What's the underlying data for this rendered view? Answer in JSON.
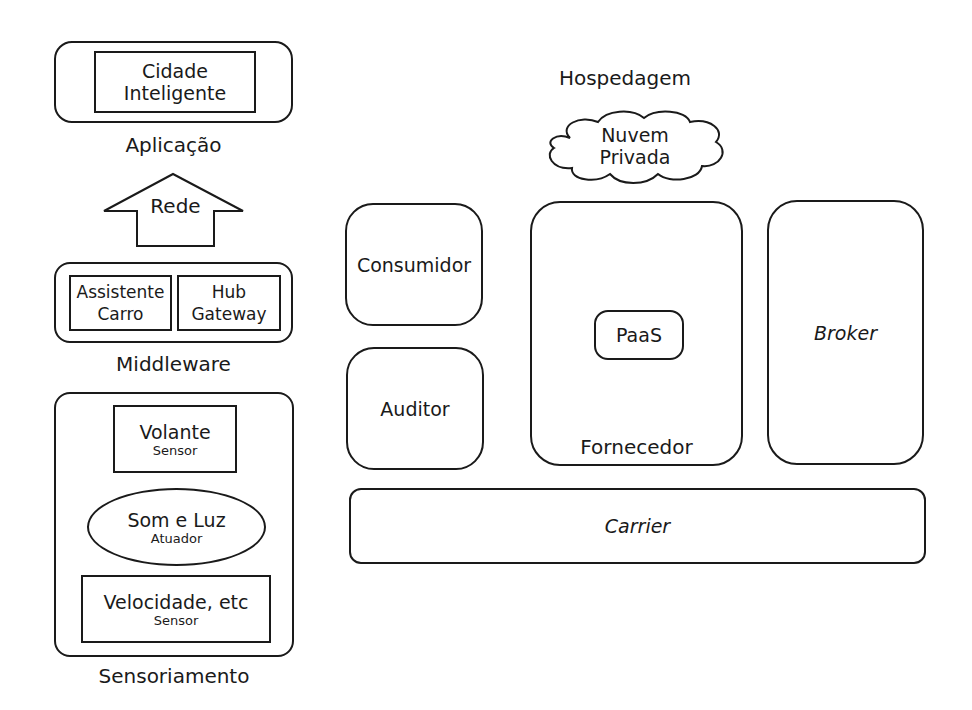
{
  "left_stack": {
    "application": {
      "inner_box": [
        "Cidade",
        "Inteligente"
      ],
      "caption": "Aplicação"
    },
    "network_arrow": {
      "label": "Rede",
      "direction": "up"
    },
    "middleware": {
      "boxes": [
        {
          "lines": [
            "Assistente",
            "Carro"
          ]
        },
        {
          "lines": [
            "Hub",
            "Gateway"
          ]
        }
      ],
      "caption": "Middleware"
    },
    "sensing": {
      "items": [
        {
          "shape": "rectangle",
          "title": "Volante",
          "subtitle": "Sensor"
        },
        {
          "shape": "ellipse",
          "title": "Som e Luz",
          "subtitle": "Atuador"
        },
        {
          "shape": "rectangle",
          "title": "Velocidade, etc",
          "subtitle": "Sensor"
        }
      ],
      "caption": "Sensoriamento"
    }
  },
  "cloud_roles": {
    "hosting": {
      "caption": "Hospedagem",
      "cloud": [
        "Nuvem",
        "Privada"
      ]
    },
    "consumer": "Consumidor",
    "auditor": "Auditor",
    "provider": {
      "service": "PaaS",
      "caption": "Fornecedor"
    },
    "broker": "Broker",
    "carrier": "Carrier"
  }
}
